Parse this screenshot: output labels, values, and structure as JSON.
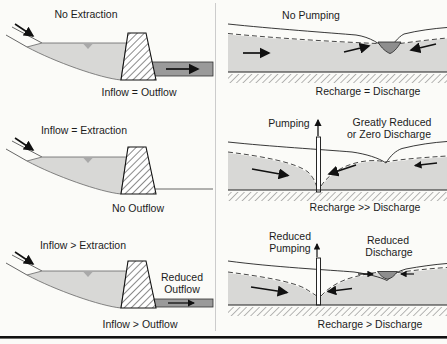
{
  "figure": {
    "left_column": {
      "panel1": {
        "title": "No Extraction",
        "caption": "Inflow = Outflow"
      },
      "panel2": {
        "title": "Inflow = Extraction",
        "caption": "No Outflow"
      },
      "panel3": {
        "title": "Inflow > Extraction",
        "label_line1": "Reduced",
        "label_line2": "Outflow",
        "caption": "Inflow > Outflow"
      }
    },
    "right_column": {
      "panel1": {
        "title": "No Pumping",
        "caption": "Recharge = Discharge"
      },
      "panel2": {
        "title": "Pumping",
        "label_line1": "Greatly Reduced",
        "label_line2": "or Zero Discharge",
        "caption": "Recharge >> Discharge"
      },
      "panel3": {
        "title_line1": "Reduced",
        "title_line2": "Pumping",
        "label_line1": "Reduced",
        "label_line2": "Discharge",
        "caption": "Recharge > Discharge"
      }
    },
    "colors": {
      "background": "#fbfbf8",
      "water_fill": "#d8d8d6",
      "aquifer_fill": "#d8d8d6",
      "stream_fill": "#8e8e8e",
      "outflow_channel_fill": "#9a9a9a",
      "water_marker": "#a9a9a9",
      "line": "#1c1c1c",
      "divider": "#cccccc"
    }
  }
}
